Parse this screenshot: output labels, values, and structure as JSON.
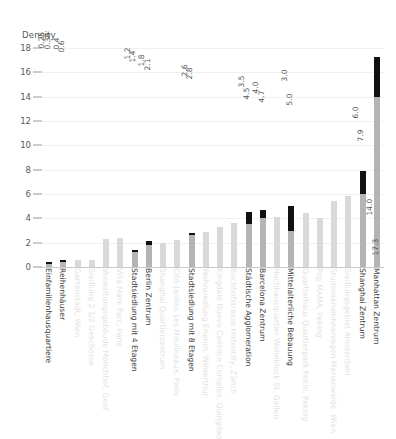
{
  "chart_data": {
    "type": "bar",
    "title": "",
    "ylabel": "Density",
    "xlabel": "",
    "ylim": [
      0,
      18
    ],
    "yticks": [
      0,
      2,
      4,
      6,
      8,
      10,
      12,
      14,
      16,
      18
    ],
    "grid": true,
    "legend": "none",
    "categories": [
      "Einfamilienhausquartiere",
      "Reihenhäuser",
      "Gartenstadt, Wien",
      "Siedlung 2 1/2 Geschosse",
      "Verwaltungsgebäude Mönchhof, Genf",
      "Villa Mare Parc, Paris",
      "Stadtsiedlung mit 4 Etagen",
      "Berlin Zentrum",
      "Shanghai Quartierzentrum",
      "Cité-Jardins Les Moulineaux, Paris",
      "Stadtsiedlung mit 8 Etagen",
      "Wohnsiedlung Erlenm, Winterthur",
      "Kingdale Nuevo Centrico Complex, Quingdao",
      "Buchhofstrasse Hafencity, Zürich",
      "Städtische Agglomeration",
      "Barcelona Zentrum",
      "Hochhausquartier Wohnblock St. Gallen",
      "Mittelalterliche Bebauung",
      "Quartierhaus Quartierpark Pekin, Peking",
      "Pop MAMA, Peking",
      "Studentenwohnanlagen Marienwalde, Wien",
      "Siedlungsgebiet Amsterdam",
      "Shanghai Zentrum",
      "Manhattan Zentrum"
    ],
    "bars": [
      {
        "label": "Einfamilienhausquartiere",
        "highlighted": true,
        "low": 0.25,
        "high": 0.38,
        "low_label": "0.25",
        "high_label": "0.38"
      },
      {
        "label": "Reihenhäuser",
        "highlighted": true,
        "low": 0.4,
        "high": 0.6,
        "low_label": "0.4",
        "high_label": "0.6"
      },
      {
        "label": "Gartenstadt, Wien",
        "highlighted": false,
        "low": 0,
        "high": 0.55,
        "low_label": "",
        "high_label": ""
      },
      {
        "label": "Siedlung 2 1/2 Geschosse",
        "highlighted": false,
        "low": 0,
        "high": 0.6,
        "low_label": "",
        "high_label": ""
      },
      {
        "label": "Verwaltungsgebäude Mönchhof, Genf",
        "highlighted": false,
        "low": 0,
        "high": 2.3,
        "low_label": "",
        "high_label": ""
      },
      {
        "label": "Villa Mare Parc, Paris",
        "highlighted": false,
        "low": 0,
        "high": 2.4,
        "low_label": "",
        "high_label": ""
      },
      {
        "label": "Stadtsiedlung mit 4 Etagen",
        "highlighted": true,
        "low": 1.2,
        "high": 1.4,
        "low_label": "1.2",
        "high_label": "1.4"
      },
      {
        "label": "Berlin Zentrum",
        "highlighted": true,
        "low": 1.8,
        "high": 2.1,
        "low_label": "1.8",
        "high_label": "2.1"
      },
      {
        "label": "Shanghai Quartierzentrum",
        "highlighted": false,
        "low": 0,
        "high": 2.0,
        "low_label": "",
        "high_label": ""
      },
      {
        "label": "Cité-Jardins Les Moulineaux, Paris",
        "highlighted": false,
        "low": 0,
        "high": 2.2,
        "low_label": "",
        "high_label": ""
      },
      {
        "label": "Stadtsiedlung mit 8 Etagen",
        "highlighted": true,
        "low": 2.6,
        "high": 2.8,
        "low_label": "2.6",
        "high_label": "2.8"
      },
      {
        "label": "Wohnsiedlung Erlenm, Winterthur",
        "highlighted": false,
        "low": 0,
        "high": 2.9,
        "low_label": "",
        "high_label": ""
      },
      {
        "label": "Kingdale Nuevo Centrico Complex, Quingdao",
        "highlighted": false,
        "low": 0,
        "high": 3.3,
        "low_label": "",
        "high_label": ""
      },
      {
        "label": "Buchhofstrasse Hafencity, Zürich",
        "highlighted": false,
        "low": 0,
        "high": 3.6,
        "low_label": "",
        "high_label": ""
      },
      {
        "label": "Städtische Agglomeration",
        "highlighted": true,
        "low": 3.5,
        "high": 4.5,
        "low_label": "3.5",
        "high_label": "4.5"
      },
      {
        "label": "Barcelona Zentrum",
        "highlighted": true,
        "low": 4.0,
        "high": 4.7,
        "low_label": "4.0",
        "high_label": "4.7"
      },
      {
        "label": "Hochhausquartier Wohnblock St. Gallen",
        "highlighted": false,
        "low": 0,
        "high": 4.1,
        "low_label": "",
        "high_label": ""
      },
      {
        "label": "Mittelalterliche Bebauung",
        "highlighted": true,
        "low": 3.0,
        "high": 5.0,
        "low_label": "3.0",
        "high_label": "5.0"
      },
      {
        "label": "Quartierhaus Quartierpark Pekin, Peking",
        "highlighted": false,
        "low": 0,
        "high": 4.4,
        "low_label": "",
        "high_label": ""
      },
      {
        "label": "Pop MAMA, Peking",
        "highlighted": false,
        "low": 0,
        "high": 4.0,
        "low_label": "",
        "high_label": ""
      },
      {
        "label": "Studentenwohnanlagen Marienwalde, Wien",
        "highlighted": false,
        "low": 0,
        "high": 5.4,
        "low_label": "",
        "high_label": ""
      },
      {
        "label": "Siedlungsgebiet Amsterdam",
        "highlighted": false,
        "low": 0,
        "high": 5.8,
        "low_label": "",
        "high_label": ""
      },
      {
        "label": "Shanghai Zentrum",
        "highlighted": true,
        "low": 6.0,
        "high": 7.9,
        "low_label": "6.0",
        "high_label": "7.9"
      },
      {
        "label": "Manhattan Zentrum",
        "highlighted": true,
        "low": 14.0,
        "high": 17.3,
        "low_label": "14.0",
        "high_label": "17.3"
      }
    ]
  }
}
